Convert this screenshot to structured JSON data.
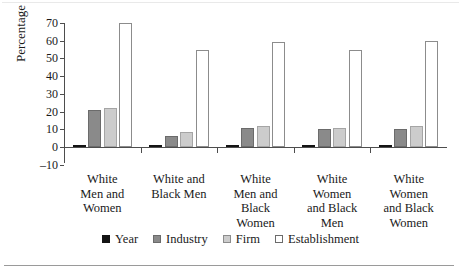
{
  "chart_data": {
    "type": "bar",
    "title": "",
    "xlabel": "",
    "ylabel": "Percentage",
    "ylim": [
      -10,
      70
    ],
    "yticks": [
      -10,
      0,
      10,
      20,
      30,
      40,
      50,
      60,
      70
    ],
    "grid": false,
    "legend_position": "bottom",
    "categories": [
      "White Men and Women",
      "White and Black Men",
      "White Men and Black Women",
      "White Women and Black Men",
      "White Women and Black Women"
    ],
    "series": [
      {
        "name": "Year",
        "color": "#141414",
        "values": [
          1,
          0.4,
          1,
          0.5,
          0.5
        ]
      },
      {
        "name": "Industry",
        "color": "#8a8a8a",
        "values": [
          21,
          6,
          11,
          10,
          10
        ]
      },
      {
        "name": "Firm",
        "color": "#cccccc",
        "values": [
          22,
          8.5,
          12,
          11,
          12
        ]
      },
      {
        "name": "Establishment",
        "color": "#ffffff",
        "values": [
          70,
          55,
          59,
          55,
          60
        ]
      }
    ]
  },
  "axis": {
    "y_title": "Percentage",
    "y_tick_labels": [
      "70",
      "60",
      "50",
      "40",
      "30",
      "20",
      "10",
      "0",
      "–10"
    ]
  },
  "categories": [
    {
      "lines": [
        "White",
        "Men and",
        "Women"
      ]
    },
    {
      "lines": [
        "White and",
        "Black Men"
      ]
    },
    {
      "lines": [
        "White",
        "Men and",
        "Black",
        "Women"
      ]
    },
    {
      "lines": [
        "White",
        "Women",
        "and Black",
        "Men"
      ]
    },
    {
      "lines": [
        "White",
        "Women",
        "and Black",
        "Women"
      ]
    }
  ],
  "legend": {
    "items": [
      {
        "label": "Year",
        "key": "year"
      },
      {
        "label": "Industry",
        "key": "industry"
      },
      {
        "label": "Firm",
        "key": "firm"
      },
      {
        "label": "Establishment",
        "key": "establishment"
      }
    ]
  }
}
